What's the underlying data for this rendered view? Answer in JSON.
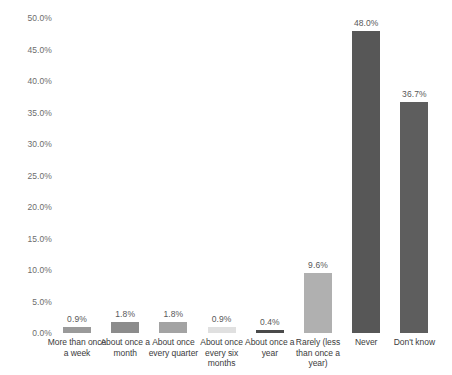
{
  "chart_data": {
    "type": "bar",
    "title": "",
    "subtitle": "",
    "xlabel": "",
    "ylabel": "",
    "ylim": [
      0,
      50
    ],
    "grid": false,
    "legend": "none",
    "y_tick_labels": [
      "50.0%",
      "45.0%",
      "40.0%",
      "35.0%",
      "30.0%",
      "25.0%",
      "20.0%",
      "15.0%",
      "10.0%",
      "5.0%",
      "0.0%"
    ],
    "y_tick_values": [
      50.0,
      45.0,
      40.0,
      35.0,
      30.0,
      25.0,
      20.0,
      15.0,
      10.0,
      5.0,
      0.0
    ],
    "categories": [
      "More than once a week",
      "About once a month",
      "About once every quarter",
      "About once every six months",
      "About once a year",
      "Rarely (less than once a year)",
      "Never",
      "Don't know"
    ],
    "values": [
      0.9,
      1.8,
      1.8,
      0.9,
      0.4,
      9.6,
      48.0,
      36.7
    ],
    "value_labels": [
      "0.9%",
      "1.8%",
      "1.8%",
      "0.9%",
      "0.4%",
      "9.6%",
      "48.0%",
      "36.7%"
    ],
    "bar_colors": [
      "#9a9a9a",
      "#8c8c8c",
      "#a3a3a3",
      "#e0e0e0",
      "#4a4a4a",
      "#b0b0b0",
      "#575757",
      "#5e5e5e"
    ]
  }
}
